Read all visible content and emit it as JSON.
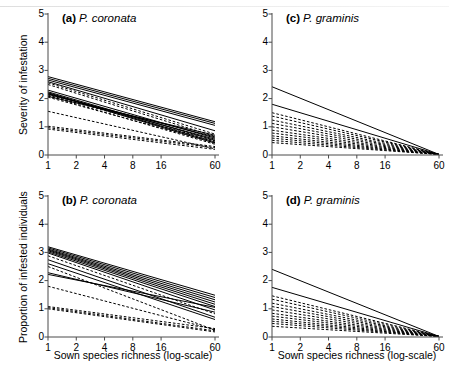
{
  "figure": {
    "width": 449,
    "height": 368,
    "background": "#ffffff",
    "line_color": "#000000"
  },
  "axes": {
    "x_ticks": [
      "1",
      "2",
      "4",
      "8",
      "16",
      "60"
    ],
    "x_tick_values": [
      1,
      2,
      4,
      8,
      16,
      60
    ],
    "x_scale": "log",
    "x_label": "Sown species richness (log-scale)",
    "y_ticks": [
      "0",
      "1",
      "2",
      "3",
      "4",
      "5"
    ],
    "y_tick_values": [
      0,
      1,
      2,
      3,
      4,
      5
    ],
    "y_lim": [
      0,
      5
    ],
    "y_label_top": "Severity of infestation",
    "y_label_bottom": "Proportion of infested individuals"
  },
  "panels": {
    "a": {
      "tag": "(a)",
      "species": "P. coronata"
    },
    "b": {
      "tag": "(b)",
      "species": "P. coronata"
    },
    "c": {
      "tag": "(c)",
      "species": "P. graminis"
    },
    "d": {
      "tag": "(d)",
      "species": "P. graminis"
    }
  },
  "chart_data": [
    {
      "id": "a",
      "type": "line",
      "title": "(a) P. coronata",
      "xlabel": "Sown species richness (log-scale)",
      "ylabel": "Severity of infestation",
      "xscale": "log",
      "xlim": [
        1,
        60
      ],
      "ylim": [
        0,
        5
      ],
      "x_ticks": [
        1,
        2,
        4,
        8,
        16,
        60
      ],
      "y_ticks": [
        0,
        1,
        2,
        3,
        4,
        5
      ],
      "grid": false,
      "legend": "none",
      "note": "Each line is one fitted regression; solid = significant, dashed = non-significant. Endpoints given at x=1 and x=60.",
      "series": [
        {
          "name": "s1",
          "style": "solid",
          "x": [
            1,
            60
          ],
          "values": [
            2.78,
            1.18
          ]
        },
        {
          "name": "s2",
          "style": "solid",
          "x": [
            1,
            60
          ],
          "values": [
            2.72,
            1.12
          ]
        },
        {
          "name": "s3",
          "style": "solid",
          "x": [
            1,
            60
          ],
          "values": [
            2.66,
            1.05
          ]
        },
        {
          "name": "s4",
          "style": "solid",
          "x": [
            1,
            60
          ],
          "values": [
            2.6,
            0.86
          ]
        },
        {
          "name": "s5",
          "style": "dashed",
          "x": [
            1,
            60
          ],
          "values": [
            2.56,
            0.74
          ]
        },
        {
          "name": "s6",
          "style": "dashed",
          "x": [
            1,
            60
          ],
          "values": [
            2.5,
            0.66
          ]
        },
        {
          "name": "s7",
          "style": "solid",
          "x": [
            1,
            60
          ],
          "values": [
            2.3,
            0.6
          ]
        },
        {
          "name": "s8",
          "style": "solid",
          "x": [
            1,
            60
          ],
          "values": [
            2.24,
            0.52
          ]
        },
        {
          "name": "s9",
          "style": "solid",
          "x": [
            1,
            60
          ],
          "values": [
            2.21,
            0.46
          ]
        },
        {
          "name": "s10",
          "style": "solid",
          "x": [
            1,
            60
          ],
          "values": [
            2.19,
            0.42
          ]
        },
        {
          "name": "s11",
          "style": "solid",
          "x": [
            1,
            60
          ],
          "values": [
            2.17,
            0.56
          ]
        },
        {
          "name": "s12",
          "style": "solid",
          "x": [
            1,
            60
          ],
          "values": [
            2.15,
            0.64
          ]
        },
        {
          "name": "s13",
          "style": "dashed",
          "x": [
            1,
            60
          ],
          "values": [
            2.13,
            0.5
          ]
        },
        {
          "name": "s14",
          "style": "dashed",
          "x": [
            1,
            60
          ],
          "values": [
            2.1,
            0.38
          ]
        },
        {
          "name": "s15",
          "style": "solid",
          "x": [
            1,
            60
          ],
          "values": [
            2.08,
            0.7
          ]
        },
        {
          "name": "s16",
          "style": "dashed",
          "x": [
            1,
            60
          ],
          "values": [
            2.05,
            0.44
          ]
        },
        {
          "name": "s17",
          "style": "dashed",
          "x": [
            1,
            60
          ],
          "values": [
            1.55,
            0.22
          ]
        },
        {
          "name": "s18",
          "style": "dashed",
          "x": [
            1,
            60
          ],
          "values": [
            1.02,
            0.3
          ]
        },
        {
          "name": "s19",
          "style": "dashed",
          "x": [
            1,
            60
          ],
          "values": [
            0.97,
            0.26
          ]
        },
        {
          "name": "s20",
          "style": "dashed",
          "x": [
            1,
            60
          ],
          "values": [
            0.92,
            0.2
          ]
        }
      ]
    },
    {
      "id": "b",
      "type": "line",
      "title": "(b) P. coronata",
      "xlabel": "Sown species richness (log-scale)",
      "ylabel": "Proportion of infested individuals",
      "xscale": "log",
      "xlim": [
        1,
        60
      ],
      "ylim": [
        0,
        5
      ],
      "x_ticks": [
        1,
        2,
        4,
        8,
        16,
        60
      ],
      "y_ticks": [
        0,
        1,
        2,
        3,
        4,
        5
      ],
      "grid": false,
      "legend": "none",
      "note": "Each line is one fitted regression; solid = significant, dashed = non-significant. Endpoints given at x=1 and x=60.",
      "series": [
        {
          "name": "s1",
          "style": "solid",
          "x": [
            1,
            60
          ],
          "values": [
            3.2,
            1.48
          ]
        },
        {
          "name": "s2",
          "style": "solid",
          "x": [
            1,
            60
          ],
          "values": [
            3.16,
            1.4
          ]
        },
        {
          "name": "s3",
          "style": "solid",
          "x": [
            1,
            60
          ],
          "values": [
            3.12,
            1.32
          ]
        },
        {
          "name": "s4",
          "style": "solid",
          "x": [
            1,
            60
          ],
          "values": [
            3.09,
            1.24
          ]
        },
        {
          "name": "s5",
          "style": "solid",
          "x": [
            1,
            60
          ],
          "values": [
            3.06,
            1.16
          ]
        },
        {
          "name": "s6",
          "style": "solid",
          "x": [
            1,
            60
          ],
          "values": [
            3.02,
            1.08
          ]
        },
        {
          "name": "s7",
          "style": "solid",
          "x": [
            1,
            60
          ],
          "values": [
            2.98,
            0.96
          ]
        },
        {
          "name": "s8",
          "style": "dashed",
          "x": [
            1,
            60
          ],
          "values": [
            2.88,
            0.82
          ]
        },
        {
          "name": "s9",
          "style": "solid",
          "x": [
            1,
            60
          ],
          "values": [
            2.74,
            0.7
          ]
        },
        {
          "name": "s10",
          "style": "solid",
          "x": [
            1,
            60
          ],
          "values": [
            2.6,
            0.62
          ]
        },
        {
          "name": "s11",
          "style": "dashed",
          "x": [
            1,
            60
          ],
          "values": [
            2.5,
            0.24
          ]
        },
        {
          "name": "s12",
          "style": "solid",
          "x": [
            1,
            60
          ],
          "values": [
            2.28,
            0.88
          ]
        },
        {
          "name": "s13",
          "style": "solid",
          "x": [
            1,
            60
          ],
          "values": [
            2.22,
            1.05
          ]
        },
        {
          "name": "s14",
          "style": "dashed",
          "x": [
            1,
            60
          ],
          "values": [
            1.8,
            0.26
          ]
        },
        {
          "name": "s15",
          "style": "dashed",
          "x": [
            1,
            60
          ],
          "values": [
            1.08,
            0.3
          ]
        },
        {
          "name": "s16",
          "style": "dashed",
          "x": [
            1,
            60
          ],
          "values": [
            1.04,
            0.22
          ]
        },
        {
          "name": "s17",
          "style": "dashed",
          "x": [
            1,
            60
          ],
          "values": [
            1.0,
            0.18
          ]
        }
      ]
    },
    {
      "id": "c",
      "type": "line",
      "title": "(c) P. graminis",
      "xlabel": "Sown species richness (log-scale)",
      "ylabel": "Severity of infestation",
      "xscale": "log",
      "xlim": [
        1,
        60
      ],
      "ylim": [
        0,
        5
      ],
      "x_ticks": [
        1,
        2,
        4,
        8,
        16,
        60
      ],
      "y_ticks": [
        0,
        1,
        2,
        3,
        4,
        5
      ],
      "grid": false,
      "legend": "none",
      "note": "Lines decline toward zero near x=32-40.",
      "series": [
        {
          "name": "s1",
          "style": "solid",
          "x": [
            1,
            60
          ],
          "values": [
            2.42,
            0.02
          ]
        },
        {
          "name": "s2",
          "style": "solid",
          "x": [
            1,
            60
          ],
          "values": [
            1.8,
            0.02
          ]
        },
        {
          "name": "s3",
          "style": "dashed",
          "x": [
            1,
            60
          ],
          "values": [
            1.5,
            0.02
          ]
        },
        {
          "name": "s4",
          "style": "dashed",
          "x": [
            1,
            60
          ],
          "values": [
            1.38,
            0.02
          ]
        },
        {
          "name": "s5",
          "style": "dashed",
          "x": [
            1,
            60
          ],
          "values": [
            1.24,
            0.02
          ]
        },
        {
          "name": "s6",
          "style": "dashed",
          "x": [
            1,
            60
          ],
          "values": [
            1.12,
            0.02
          ]
        },
        {
          "name": "s7",
          "style": "dashed",
          "x": [
            1,
            60
          ],
          "values": [
            1.0,
            0.02
          ]
        },
        {
          "name": "s8",
          "style": "dashed",
          "x": [
            1,
            60
          ],
          "values": [
            0.88,
            0.02
          ]
        },
        {
          "name": "s9",
          "style": "dashed",
          "x": [
            1,
            60
          ],
          "values": [
            0.78,
            0.02
          ]
        },
        {
          "name": "s10",
          "style": "dashed",
          "x": [
            1,
            60
          ],
          "values": [
            0.68,
            0.02
          ]
        },
        {
          "name": "s11",
          "style": "dashed",
          "x": [
            1,
            60
          ],
          "values": [
            0.6,
            0.02
          ]
        },
        {
          "name": "s12",
          "style": "dashed",
          "x": [
            1,
            60
          ],
          "values": [
            0.52,
            0.02
          ]
        },
        {
          "name": "s13",
          "style": "dashed",
          "x": [
            1,
            60
          ],
          "values": [
            0.44,
            0.02
          ]
        }
      ]
    },
    {
      "id": "d",
      "type": "line",
      "title": "(d) P. graminis",
      "xlabel": "Sown species richness (log-scale)",
      "ylabel": "Proportion of infested individuals",
      "xscale": "log",
      "xlim": [
        1,
        60
      ],
      "ylim": [
        0,
        5
      ],
      "x_ticks": [
        1,
        2,
        4,
        8,
        16,
        60
      ],
      "y_ticks": [
        0,
        1,
        2,
        3,
        4,
        5
      ],
      "grid": false,
      "legend": "none",
      "note": "Lines decline toward zero near x=32-40.",
      "series": [
        {
          "name": "s1",
          "style": "solid",
          "x": [
            1,
            60
          ],
          "values": [
            2.4,
            0.02
          ]
        },
        {
          "name": "s2",
          "style": "solid",
          "x": [
            1,
            60
          ],
          "values": [
            1.76,
            0.02
          ]
        },
        {
          "name": "s3",
          "style": "dashed",
          "x": [
            1,
            60
          ],
          "values": [
            1.46,
            0.02
          ]
        },
        {
          "name": "s4",
          "style": "dashed",
          "x": [
            1,
            60
          ],
          "values": [
            1.34,
            0.02
          ]
        },
        {
          "name": "s5",
          "style": "dashed",
          "x": [
            1,
            60
          ],
          "values": [
            1.2,
            0.02
          ]
        },
        {
          "name": "s6",
          "style": "dashed",
          "x": [
            1,
            60
          ],
          "values": [
            1.08,
            0.02
          ]
        },
        {
          "name": "s7",
          "style": "dashed",
          "x": [
            1,
            60
          ],
          "values": [
            0.96,
            0.02
          ]
        },
        {
          "name": "s8",
          "style": "dashed",
          "x": [
            1,
            60
          ],
          "values": [
            0.84,
            0.02
          ]
        },
        {
          "name": "s9",
          "style": "dashed",
          "x": [
            1,
            60
          ],
          "values": [
            0.74,
            0.02
          ]
        },
        {
          "name": "s10",
          "style": "dashed",
          "x": [
            1,
            60
          ],
          "values": [
            0.64,
            0.02
          ]
        },
        {
          "name": "s11",
          "style": "dashed",
          "x": [
            1,
            60
          ],
          "values": [
            0.56,
            0.02
          ]
        },
        {
          "name": "s12",
          "style": "dashed",
          "x": [
            1,
            60
          ],
          "values": [
            0.48,
            0.02
          ]
        },
        {
          "name": "s13",
          "style": "dashed",
          "x": [
            1,
            60
          ],
          "values": [
            0.38,
            0.02
          ]
        }
      ]
    }
  ]
}
